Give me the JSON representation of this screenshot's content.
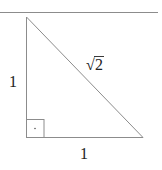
{
  "diagram": {
    "type": "right-triangle",
    "labels": {
      "left_leg": "1",
      "bottom_leg": "1",
      "hypotenuse": "2",
      "hypotenuse_prefix": "√"
    },
    "right_angle_marker": "·",
    "colors": {
      "lines": "#8c8c8c",
      "rule": "#8c8c8c",
      "text": "#222222"
    }
  }
}
